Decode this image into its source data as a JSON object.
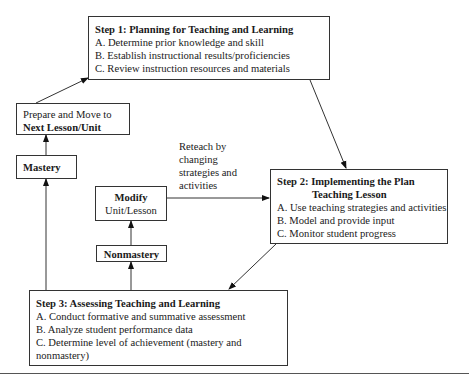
{
  "step1": {
    "title": "Step 1:  Planning for Teaching and Learning",
    "items": [
      "A.  Determine prior knowledge and skill",
      "B.  Establish instructional results/proficiencies",
      "C.  Review instruction resources and materials"
    ]
  },
  "step2": {
    "title_line1": "Step 2:  Implementing the Plan",
    "title_line2": "Teaching Lesson",
    "items": [
      "A.  Use teaching strategies and activities",
      "B.  Model and provide input",
      "C.  Monitor student progress"
    ]
  },
  "step3": {
    "title": "Step 3:  Assessing Teaching and Learning",
    "items": [
      "A.  Conduct formative and summative assessment",
      "B.  Analyze student performance data",
      "C.  Determine level of achievement (mastery and",
      "nonmastery)"
    ]
  },
  "prepare": {
    "line1": "Prepare and Move to",
    "line2": "Next Lesson/Unit"
  },
  "mastery": {
    "label": "Mastery"
  },
  "nonmastery": {
    "label": "Nonmastery"
  },
  "modify": {
    "line1": "Modify",
    "line2": "Unit/Lesson"
  },
  "reteach": {
    "lines": [
      "Reteach by",
      "changing",
      "strategies and",
      "activities"
    ]
  }
}
